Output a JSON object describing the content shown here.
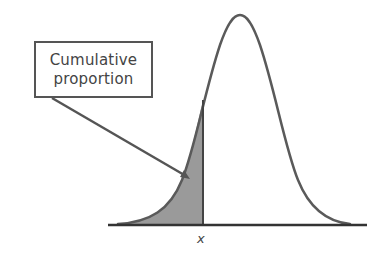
{
  "diagram": {
    "callout": {
      "line1": "Cumulative",
      "line2": "proportion"
    },
    "x_label": "x",
    "colors": {
      "curve": "#5a5a5a",
      "shade": "#9a9a9a",
      "axis": "#333333",
      "text": "#444444"
    }
  }
}
